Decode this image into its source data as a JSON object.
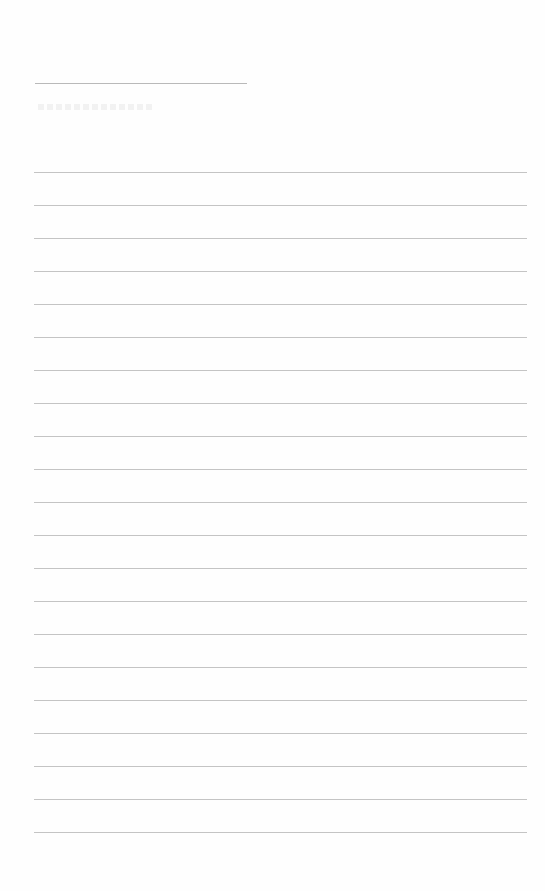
{
  "page": {
    "type": "ruled-paper",
    "background_color": "#fefefe",
    "rule_color": "#c4c4c4",
    "header_rule": {
      "x": 35,
      "y": 83,
      "width": 212
    },
    "ruled_lines": {
      "count": 21,
      "x_start": 34,
      "x_end": 527,
      "first_y": 172,
      "spacing": 33
    }
  }
}
